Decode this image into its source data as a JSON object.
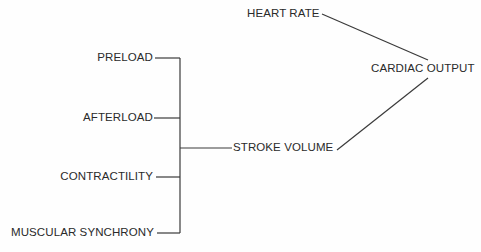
{
  "diagram": {
    "title": "",
    "nodes": {
      "preload": "PRELOAD",
      "afterload": "AFTERLOAD",
      "contractility": "CONTRACTILITY",
      "muscular_synchrony": "MUSCULAR SYNCHRONY",
      "stroke_volume": "STROKE VOLUME",
      "heart_rate": "HEART RATE",
      "cardiac_output": "CARDIAC OUTPUT"
    },
    "edges": [
      {
        "from": "PRELOAD",
        "to": "STROKE VOLUME"
      },
      {
        "from": "AFTERLOAD",
        "to": "STROKE VOLUME"
      },
      {
        "from": "CONTRACTILITY",
        "to": "STROKE VOLUME"
      },
      {
        "from": "MUSCULAR SYNCHRONY",
        "to": "STROKE VOLUME"
      },
      {
        "from": "HEART RATE",
        "to": "CARDIAC OUTPUT"
      },
      {
        "from": "STROKE VOLUME",
        "to": "CARDIAC OUTPUT"
      }
    ],
    "line_color": "#333333"
  }
}
